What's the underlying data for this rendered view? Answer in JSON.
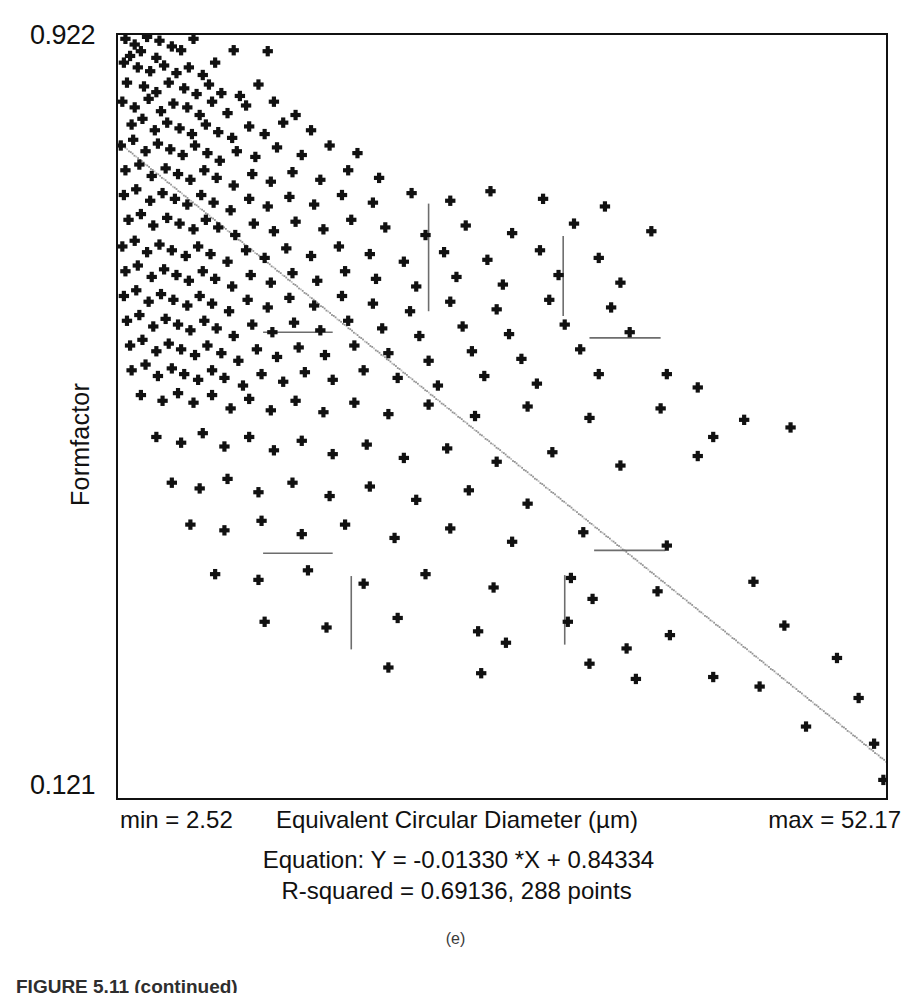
{
  "figure": {
    "subfigure_label": "(e)",
    "caption": "FIGURE 5.11 (continued)"
  },
  "axes": {
    "y_max_label": "0.922",
    "y_min_label": "0.121",
    "y_title": "Formfactor",
    "x_min_label": "min = 2.52",
    "x_title": "Equivalent Circular Diameter (µm)",
    "x_max_label": "max = 52.17"
  },
  "stats": {
    "equation_line": "Equation: Y = -0.01330 *X + 0.84334",
    "rsquared_line": "R-squared = 0.69136, 288 points"
  },
  "colors": {
    "marker": "#111111",
    "frame": "#111111",
    "fit_line": "#8d8d8d",
    "overlay_segment": "#6d6d6d",
    "background": "#ffffff"
  },
  "chart_data": {
    "type": "scatter",
    "title": "",
    "xlabel": "Equivalent Circular Diameter (µm)",
    "ylabel": "Formfactor",
    "xlim": [
      2.52,
      52.17
    ],
    "ylim": [
      0.121,
      0.922
    ],
    "grid": false,
    "legend": "none",
    "marker_style": "plus",
    "n_points": 288,
    "fit": {
      "type": "linear",
      "slope": -0.0133,
      "intercept": 0.84334,
      "r_squared": 0.69136,
      "equation_text": "Y = -0.01330 *X + 0.84334",
      "style": "dotted",
      "endpoints": [
        [
          2.52,
          0.80982
        ],
        [
          52.17,
          0.1595
        ]
      ]
    },
    "annotations": [
      {
        "kind": "vertical-segment",
        "x": 22.6,
        "y0": 0.632,
        "y1": 0.745
      },
      {
        "kind": "horizontal-segment",
        "y": 0.61,
        "x0": 11.9,
        "x1": 16.4
      },
      {
        "kind": "vertical-segment",
        "x": 31.3,
        "y0": 0.627,
        "y1": 0.711
      },
      {
        "kind": "horizontal-segment",
        "y": 0.604,
        "x0": 33.0,
        "x1": 37.6
      },
      {
        "kind": "horizontal-segment",
        "y": 0.378,
        "x0": 11.9,
        "x1": 16.4
      },
      {
        "kind": "vertical-segment",
        "x": 17.6,
        "y0": 0.277,
        "y1": 0.354
      },
      {
        "kind": "horizontal-segment",
        "y": 0.381,
        "x0": 33.3,
        "x1": 37.9
      },
      {
        "kind": "vertical-segment",
        "x": 31.4,
        "y0": 0.282,
        "y1": 0.355
      }
    ],
    "points": [
      [
        3.0,
        0.918
      ],
      [
        3.6,
        0.912
      ],
      [
        4.4,
        0.92
      ],
      [
        5.2,
        0.916
      ],
      [
        4.0,
        0.905
      ],
      [
        3.3,
        0.9
      ],
      [
        5.0,
        0.898
      ],
      [
        6.0,
        0.91
      ],
      [
        6.6,
        0.906
      ],
      [
        7.4,
        0.918
      ],
      [
        2.9,
        0.893
      ],
      [
        3.8,
        0.888
      ],
      [
        4.6,
        0.884
      ],
      [
        5.5,
        0.89
      ],
      [
        6.3,
        0.882
      ],
      [
        7.1,
        0.888
      ],
      [
        8.0,
        0.88
      ],
      [
        8.8,
        0.893
      ],
      [
        10.0,
        0.906
      ],
      [
        12.2,
        0.905
      ],
      [
        3.1,
        0.872
      ],
      [
        4.2,
        0.868
      ],
      [
        5.0,
        0.862
      ],
      [
        5.8,
        0.872
      ],
      [
        6.8,
        0.866
      ],
      [
        7.6,
        0.86
      ],
      [
        8.4,
        0.87
      ],
      [
        9.2,
        0.861
      ],
      [
        10.4,
        0.858
      ],
      [
        11.6,
        0.87
      ],
      [
        2.8,
        0.852
      ],
      [
        3.6,
        0.846
      ],
      [
        4.5,
        0.855
      ],
      [
        5.3,
        0.842
      ],
      [
        6.1,
        0.85
      ],
      [
        7.0,
        0.846
      ],
      [
        7.8,
        0.838
      ],
      [
        8.6,
        0.852
      ],
      [
        9.6,
        0.84
      ],
      [
        10.8,
        0.848
      ],
      [
        12.6,
        0.852
      ],
      [
        14.0,
        0.838
      ],
      [
        3.4,
        0.828
      ],
      [
        4.1,
        0.834
      ],
      [
        4.9,
        0.822
      ],
      [
        5.7,
        0.83
      ],
      [
        6.5,
        0.824
      ],
      [
        7.3,
        0.818
      ],
      [
        8.2,
        0.828
      ],
      [
        9.0,
        0.82
      ],
      [
        9.9,
        0.814
      ],
      [
        11.0,
        0.826
      ],
      [
        12.0,
        0.818
      ],
      [
        13.2,
        0.83
      ],
      [
        15.0,
        0.822
      ],
      [
        2.7,
        0.806
      ],
      [
        3.5,
        0.812
      ],
      [
        4.3,
        0.8
      ],
      [
        5.1,
        0.808
      ],
      [
        5.9,
        0.802
      ],
      [
        6.7,
        0.796
      ],
      [
        7.5,
        0.806
      ],
      [
        8.3,
        0.798
      ],
      [
        9.1,
        0.79
      ],
      [
        10.2,
        0.8
      ],
      [
        11.4,
        0.794
      ],
      [
        12.8,
        0.804
      ],
      [
        14.4,
        0.796
      ],
      [
        16.2,
        0.806
      ],
      [
        18.0,
        0.798
      ],
      [
        3.0,
        0.78
      ],
      [
        3.9,
        0.786
      ],
      [
        4.7,
        0.774
      ],
      [
        5.6,
        0.782
      ],
      [
        6.4,
        0.776
      ],
      [
        7.2,
        0.77
      ],
      [
        8.1,
        0.78
      ],
      [
        8.9,
        0.772
      ],
      [
        10.0,
        0.764
      ],
      [
        11.2,
        0.776
      ],
      [
        12.4,
        0.768
      ],
      [
        13.8,
        0.778
      ],
      [
        15.6,
        0.77
      ],
      [
        17.4,
        0.78
      ],
      [
        19.4,
        0.772
      ],
      [
        2.9,
        0.754
      ],
      [
        3.7,
        0.76
      ],
      [
        4.6,
        0.748
      ],
      [
        5.4,
        0.756
      ],
      [
        6.2,
        0.75
      ],
      [
        7.0,
        0.744
      ],
      [
        7.9,
        0.754
      ],
      [
        8.7,
        0.746
      ],
      [
        9.8,
        0.738
      ],
      [
        11.0,
        0.75
      ],
      [
        12.2,
        0.742
      ],
      [
        13.6,
        0.752
      ],
      [
        15.2,
        0.744
      ],
      [
        17.0,
        0.754
      ],
      [
        19.0,
        0.746
      ],
      [
        21.5,
        0.756
      ],
      [
        24.0,
        0.748
      ],
      [
        26.6,
        0.758
      ],
      [
        30.0,
        0.75
      ],
      [
        34.0,
        0.742
      ],
      [
        3.2,
        0.728
      ],
      [
        4.0,
        0.734
      ],
      [
        4.8,
        0.722
      ],
      [
        5.7,
        0.73
      ],
      [
        6.5,
        0.724
      ],
      [
        7.4,
        0.718
      ],
      [
        8.2,
        0.728
      ],
      [
        9.0,
        0.72
      ],
      [
        10.1,
        0.712
      ],
      [
        11.3,
        0.724
      ],
      [
        12.6,
        0.716
      ],
      [
        14.0,
        0.726
      ],
      [
        15.8,
        0.718
      ],
      [
        17.6,
        0.728
      ],
      [
        19.8,
        0.72
      ],
      [
        22.4,
        0.712
      ],
      [
        25.0,
        0.722
      ],
      [
        28.0,
        0.714
      ],
      [
        32.0,
        0.724
      ],
      [
        37.0,
        0.716
      ],
      [
        2.8,
        0.7
      ],
      [
        3.6,
        0.706
      ],
      [
        4.4,
        0.694
      ],
      [
        5.2,
        0.702
      ],
      [
        6.0,
        0.696
      ],
      [
        6.9,
        0.69
      ],
      [
        7.7,
        0.7
      ],
      [
        8.5,
        0.692
      ],
      [
        9.6,
        0.684
      ],
      [
        10.8,
        0.696
      ],
      [
        12.0,
        0.688
      ],
      [
        13.4,
        0.698
      ],
      [
        15.0,
        0.69
      ],
      [
        16.8,
        0.7
      ],
      [
        18.8,
        0.692
      ],
      [
        21.0,
        0.684
      ],
      [
        23.6,
        0.694
      ],
      [
        26.4,
        0.686
      ],
      [
        29.8,
        0.696
      ],
      [
        33.6,
        0.688
      ],
      [
        3.0,
        0.674
      ],
      [
        3.8,
        0.68
      ],
      [
        4.7,
        0.668
      ],
      [
        5.5,
        0.676
      ],
      [
        6.3,
        0.67
      ],
      [
        7.1,
        0.664
      ],
      [
        8.0,
        0.674
      ],
      [
        8.8,
        0.666
      ],
      [
        9.9,
        0.658
      ],
      [
        11.1,
        0.67
      ],
      [
        12.4,
        0.662
      ],
      [
        13.8,
        0.672
      ],
      [
        15.4,
        0.664
      ],
      [
        17.2,
        0.674
      ],
      [
        19.2,
        0.666
      ],
      [
        21.8,
        0.658
      ],
      [
        24.4,
        0.668
      ],
      [
        27.4,
        0.66
      ],
      [
        31.0,
        0.67
      ],
      [
        35.0,
        0.662
      ],
      [
        2.9,
        0.648
      ],
      [
        3.7,
        0.654
      ],
      [
        4.5,
        0.642
      ],
      [
        5.3,
        0.65
      ],
      [
        6.1,
        0.644
      ],
      [
        7.0,
        0.638
      ],
      [
        7.8,
        0.648
      ],
      [
        8.6,
        0.64
      ],
      [
        9.7,
        0.632
      ],
      [
        10.9,
        0.644
      ],
      [
        12.2,
        0.636
      ],
      [
        13.6,
        0.646
      ],
      [
        15.2,
        0.638
      ],
      [
        17.0,
        0.648
      ],
      [
        19.0,
        0.64
      ],
      [
        21.4,
        0.632
      ],
      [
        24.0,
        0.642
      ],
      [
        27.0,
        0.634
      ],
      [
        30.4,
        0.644
      ],
      [
        34.4,
        0.636
      ],
      [
        3.1,
        0.622
      ],
      [
        3.9,
        0.628
      ],
      [
        4.8,
        0.616
      ],
      [
        5.6,
        0.624
      ],
      [
        6.4,
        0.618
      ],
      [
        7.2,
        0.612
      ],
      [
        8.1,
        0.622
      ],
      [
        8.9,
        0.614
      ],
      [
        10.0,
        0.606
      ],
      [
        11.2,
        0.618
      ],
      [
        12.5,
        0.61
      ],
      [
        13.9,
        0.62
      ],
      [
        15.6,
        0.612
      ],
      [
        17.4,
        0.622
      ],
      [
        19.6,
        0.614
      ],
      [
        22.0,
        0.606
      ],
      [
        24.8,
        0.616
      ],
      [
        27.8,
        0.608
      ],
      [
        31.4,
        0.618
      ],
      [
        35.6,
        0.61
      ],
      [
        3.3,
        0.596
      ],
      [
        4.1,
        0.602
      ],
      [
        5.0,
        0.59
      ],
      [
        5.8,
        0.598
      ],
      [
        6.6,
        0.592
      ],
      [
        7.5,
        0.586
      ],
      [
        8.3,
        0.596
      ],
      [
        9.2,
        0.588
      ],
      [
        10.3,
        0.58
      ],
      [
        11.5,
        0.592
      ],
      [
        12.8,
        0.584
      ],
      [
        14.2,
        0.594
      ],
      [
        15.9,
        0.586
      ],
      [
        17.8,
        0.596
      ],
      [
        20.0,
        0.588
      ],
      [
        22.6,
        0.58
      ],
      [
        25.4,
        0.59
      ],
      [
        28.6,
        0.582
      ],
      [
        32.4,
        0.592
      ],
      [
        38.0,
        0.566
      ],
      [
        3.4,
        0.57
      ],
      [
        4.3,
        0.576
      ],
      [
        5.1,
        0.564
      ],
      [
        6.0,
        0.572
      ],
      [
        6.8,
        0.566
      ],
      [
        7.7,
        0.56
      ],
      [
        8.6,
        0.57
      ],
      [
        9.4,
        0.562
      ],
      [
        10.6,
        0.554
      ],
      [
        11.8,
        0.566
      ],
      [
        13.2,
        0.558
      ],
      [
        14.6,
        0.568
      ],
      [
        16.4,
        0.56
      ],
      [
        18.4,
        0.57
      ],
      [
        20.6,
        0.562
      ],
      [
        23.2,
        0.554
      ],
      [
        26.2,
        0.564
      ],
      [
        29.6,
        0.556
      ],
      [
        33.6,
        0.566
      ],
      [
        40.0,
        0.552
      ],
      [
        4.0,
        0.544
      ],
      [
        5.4,
        0.538
      ],
      [
        6.4,
        0.546
      ],
      [
        7.4,
        0.536
      ],
      [
        8.6,
        0.544
      ],
      [
        9.8,
        0.53
      ],
      [
        11.0,
        0.54
      ],
      [
        12.4,
        0.528
      ],
      [
        14.0,
        0.538
      ],
      [
        15.8,
        0.526
      ],
      [
        17.8,
        0.536
      ],
      [
        20.0,
        0.524
      ],
      [
        22.6,
        0.534
      ],
      [
        25.6,
        0.522
      ],
      [
        29.0,
        0.532
      ],
      [
        33.0,
        0.52
      ],
      [
        37.6,
        0.53
      ],
      [
        43.0,
        0.518
      ],
      [
        46.0,
        0.51
      ],
      [
        41.0,
        0.5
      ],
      [
        5.0,
        0.5
      ],
      [
        6.6,
        0.494
      ],
      [
        8.0,
        0.504
      ],
      [
        9.4,
        0.49
      ],
      [
        11.0,
        0.5
      ],
      [
        12.6,
        0.486
      ],
      [
        14.4,
        0.496
      ],
      [
        16.4,
        0.482
      ],
      [
        18.6,
        0.492
      ],
      [
        21.0,
        0.478
      ],
      [
        23.8,
        0.488
      ],
      [
        27.0,
        0.474
      ],
      [
        30.6,
        0.484
      ],
      [
        35.0,
        0.47
      ],
      [
        40.0,
        0.48
      ],
      [
        6.0,
        0.452
      ],
      [
        7.8,
        0.446
      ],
      [
        9.6,
        0.456
      ],
      [
        11.6,
        0.442
      ],
      [
        13.8,
        0.452
      ],
      [
        16.2,
        0.438
      ],
      [
        18.8,
        0.448
      ],
      [
        21.8,
        0.434
      ],
      [
        25.2,
        0.444
      ],
      [
        29.0,
        0.43
      ],
      [
        7.2,
        0.408
      ],
      [
        9.4,
        0.402
      ],
      [
        11.8,
        0.412
      ],
      [
        14.4,
        0.398
      ],
      [
        17.2,
        0.408
      ],
      [
        20.4,
        0.394
      ],
      [
        24.0,
        0.404
      ],
      [
        28.0,
        0.39
      ],
      [
        32.6,
        0.4
      ],
      [
        38.0,
        0.386
      ],
      [
        8.8,
        0.356
      ],
      [
        11.6,
        0.35
      ],
      [
        14.8,
        0.36
      ],
      [
        18.4,
        0.346
      ],
      [
        22.4,
        0.356
      ],
      [
        26.8,
        0.342
      ],
      [
        31.8,
        0.352
      ],
      [
        37.4,
        0.338
      ],
      [
        43.6,
        0.348
      ],
      [
        33.2,
        0.33
      ],
      [
        12.0,
        0.306
      ],
      [
        16.0,
        0.3
      ],
      [
        20.6,
        0.31
      ],
      [
        25.8,
        0.296
      ],
      [
        31.6,
        0.306
      ],
      [
        38.2,
        0.292
      ],
      [
        45.6,
        0.302
      ],
      [
        27.6,
        0.284
      ],
      [
        35.4,
        0.278
      ],
      [
        49.0,
        0.268
      ],
      [
        20.0,
        0.258
      ],
      [
        26.0,
        0.252
      ],
      [
        33.0,
        0.262
      ],
      [
        41.0,
        0.248
      ],
      [
        50.4,
        0.226
      ],
      [
        47.0,
        0.196
      ],
      [
        51.4,
        0.178
      ],
      [
        52.0,
        0.14
      ],
      [
        44.0,
        0.238
      ],
      [
        36.0,
        0.246
      ]
    ]
  }
}
